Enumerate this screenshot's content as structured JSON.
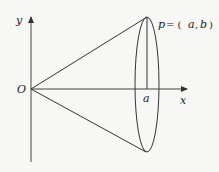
{
  "diagram": {
    "labels": {
      "y_axis": "y",
      "x_axis": "x",
      "origin": "O",
      "a_tick": "a",
      "point_p": "p",
      "point_eq": "= (",
      "point_a": "a",
      "point_comma": ",",
      "point_b": "b",
      "point_close": ")"
    },
    "colors": {
      "stroke": "#333333",
      "background": "#f7f7f5"
    }
  }
}
